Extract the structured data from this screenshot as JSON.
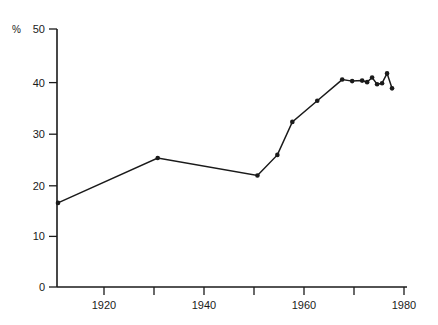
{
  "chart_data": {
    "type": "line",
    "title": "",
    "subtitle": "",
    "xlabel": "",
    "ylabel": "%",
    "ylabel_position": "top-left",
    "xlim": [
      1910.8,
      1981.0
    ],
    "ylim": [
      0,
      50
    ],
    "grid": false,
    "legend": null,
    "y_ticks": [
      0,
      10,
      20,
      30,
      40,
      50
    ],
    "y_tick_labels": [
      "0",
      "10",
      "20",
      "30",
      "40",
      "50"
    ],
    "x_ticks": [
      1920,
      1930,
      1940,
      1950,
      1960,
      1970,
      1980
    ],
    "x_tick_labels": [
      "1920",
      "",
      "1940",
      "",
      "1960",
      "",
      "1980"
    ],
    "x_labeled_ticks": [
      1920,
      1940,
      1960,
      1980
    ],
    "marker": "filled-circle",
    "line_color": "#1a1a1a",
    "marker_color": "#1a1a1a",
    "background_color": "#ffffff",
    "x": [
      1911,
      1931,
      1951,
      1955,
      1958,
      1963,
      1968,
      1970,
      1972,
      1973,
      1974,
      1975,
      1976,
      1977,
      1978
    ],
    "values": [
      16.3,
      25.0,
      21.6,
      25.6,
      32.0,
      36.1,
      40.2,
      39.9,
      40.0,
      39.7,
      40.6,
      39.3,
      39.5,
      41.4,
      38.5
    ],
    "points": [
      {
        "x": 1911,
        "y": 16.3
      },
      {
        "x": 1931,
        "y": 25.0
      },
      {
        "x": 1951,
        "y": 21.6
      },
      {
        "x": 1955,
        "y": 25.6
      },
      {
        "x": 1958,
        "y": 32.0
      },
      {
        "x": 1963,
        "y": 36.1
      },
      {
        "x": 1968,
        "y": 40.2
      },
      {
        "x": 1970,
        "y": 39.9
      },
      {
        "x": 1972,
        "y": 40.0
      },
      {
        "x": 1973,
        "y": 39.7
      },
      {
        "x": 1974,
        "y": 40.6
      },
      {
        "x": 1975,
        "y": 39.3
      },
      {
        "x": 1976,
        "y": 39.5
      },
      {
        "x": 1977,
        "y": 41.4
      },
      {
        "x": 1978,
        "y": 38.5
      }
    ]
  }
}
